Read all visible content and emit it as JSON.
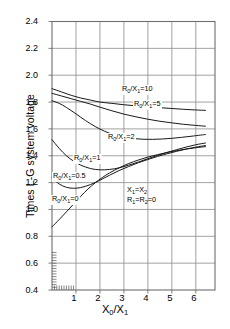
{
  "chart_data": {
    "type": "line",
    "title": "",
    "xlabel": "X0/X1",
    "ylabel": "Times L-G system voltage",
    "xlim": [
      0,
      6.8
    ],
    "ylim": [
      0.4,
      2.4
    ],
    "xticks": [
      "1",
      "2",
      "3",
      "4",
      "5",
      "6"
    ],
    "yticks": [
      "0.4",
      "0.6",
      "0.8",
      "1.0",
      "1.2",
      "1.4",
      "1.6",
      "1.8",
      "2.0",
      "2.2",
      "2.4"
    ],
    "grid": true,
    "legend": "inline-curve-labels",
    "annotations": [
      "X1=X2",
      "R1=R2=0"
    ],
    "series": [
      {
        "name": "R0/X1=10",
        "label": "R0/X1=10",
        "x": [
          0.0,
          0.4,
          0.8,
          1.2,
          1.6,
          2.0,
          2.5,
          3.0,
          3.5,
          4.0,
          4.5,
          5.0,
          5.5,
          6.0,
          6.4
        ],
        "values": [
          1.9,
          1.875,
          1.85,
          1.83,
          1.815,
          1.8,
          1.79,
          1.78,
          1.772,
          1.765,
          1.758,
          1.752,
          1.746,
          1.741,
          1.738
        ]
      },
      {
        "name": "R0/X1=5",
        "label": "R0/X1=5",
        "x": [
          0.0,
          0.4,
          0.8,
          1.2,
          1.6,
          2.0,
          2.5,
          3.0,
          3.5,
          4.0,
          4.5,
          5.0,
          5.5,
          6.0,
          6.4
        ],
        "values": [
          1.865,
          1.845,
          1.825,
          1.805,
          1.785,
          1.762,
          1.735,
          1.71,
          1.69,
          1.672,
          1.657,
          1.645,
          1.634,
          1.626,
          1.62
        ]
      },
      {
        "name": "R0/X1=2",
        "label": "R0/X1=2",
        "x": [
          0.0,
          0.3,
          0.6,
          1.0,
          1.4,
          1.8,
          2.2,
          2.6,
          3.0,
          3.4,
          3.8,
          4.2,
          4.6,
          5.0,
          5.4,
          5.8,
          6.2,
          6.4
        ],
        "values": [
          1.81,
          1.79,
          1.76,
          1.712,
          1.662,
          1.618,
          1.582,
          1.556,
          1.538,
          1.528,
          1.523,
          1.522,
          1.525,
          1.53,
          1.537,
          1.545,
          1.554,
          1.558
        ]
      },
      {
        "name": "R0/X1=1",
        "label": "R0/X1=1",
        "x": [
          0.0,
          0.3,
          0.6,
          0.9,
          1.2,
          1.6,
          2.0,
          2.4,
          2.8,
          3.2,
          3.6,
          4.0,
          4.4,
          4.8,
          5.2,
          5.6,
          6.0,
          6.4
        ],
        "values": [
          1.52,
          1.455,
          1.4,
          1.36,
          1.33,
          1.305,
          1.295,
          1.298,
          1.31,
          1.33,
          1.353,
          1.378,
          1.402,
          1.425,
          1.445,
          1.465,
          1.482,
          1.495
        ]
      },
      {
        "name": "R0/X1=0.5",
        "label": "R0/X1=0.5",
        "x": [
          0.0,
          0.3,
          0.6,
          0.9,
          1.2,
          1.6,
          2.0,
          2.4,
          2.8,
          3.2,
          3.6,
          4.0,
          4.4,
          4.8,
          5.2,
          5.6,
          6.0,
          6.4
        ],
        "values": [
          1.235,
          1.19,
          1.165,
          1.158,
          1.163,
          1.185,
          1.218,
          1.255,
          1.29,
          1.32,
          1.348,
          1.372,
          1.395,
          1.415,
          1.433,
          1.45,
          1.464,
          1.476
        ]
      },
      {
        "name": "R0/X1=0",
        "label": "R0/X1=0",
        "x": [
          0.0,
          0.3,
          0.6,
          0.9,
          1.2,
          1.5,
          1.8,
          2.1,
          2.4,
          2.8,
          3.2,
          3.6,
          4.0,
          4.4,
          4.8,
          5.2,
          5.6,
          6.0,
          6.4
        ],
        "values": [
          0.87,
          0.925,
          0.982,
          1.04,
          1.098,
          1.152,
          1.198,
          1.238,
          1.272,
          1.31,
          1.342,
          1.368,
          1.39,
          1.408,
          1.424,
          1.438,
          1.45,
          1.46,
          1.468
        ]
      }
    ]
  },
  "axis": {
    "ylabel_text": "Times L-G system voltage",
    "xlabel_main": "X",
    "xlabel_sub0": "0",
    "xlabel_slash": "/X",
    "xlabel_sub1": "1"
  },
  "curve_labels": [
    {
      "prefix": "R",
      "sub": "0",
      "mid": "/X",
      "sub2": "1",
      "eq": "=10"
    },
    {
      "prefix": "R",
      "sub": "0",
      "mid": "/X",
      "sub2": "1",
      "eq": "=5"
    },
    {
      "prefix": "R",
      "sub": "0",
      "mid": "/X",
      "sub2": "1",
      "eq": "=2"
    },
    {
      "prefix": "R",
      "sub": "0",
      "mid": "/X",
      "sub2": "1",
      "eq": "=1"
    },
    {
      "prefix": "R",
      "sub": "0",
      "mid": "/X",
      "sub2": "1",
      "eq": "=0.5"
    },
    {
      "prefix": "R",
      "sub": "0",
      "mid": "/X",
      "sub2": "1",
      "eq": "=0"
    }
  ],
  "note": {
    "line1_a": "X",
    "line1_sub1": "1",
    "line1_b": "=X",
    "line1_sub2": "2",
    "line2_a": "R",
    "line2_sub1": "1",
    "line2_b": "=R",
    "line2_sub2": "2",
    "line2_c": "=0"
  },
  "colors": {
    "curve": "#1a1a1a",
    "grid": "#8a8a8a",
    "axis": "#6e6e6e",
    "text": "#000000",
    "background": "#ffffff"
  }
}
